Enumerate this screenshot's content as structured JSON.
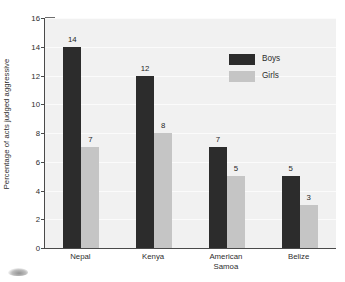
{
  "chart_data": {
    "type": "bar",
    "title": "",
    "subtitle": "",
    "xlabel": "",
    "ylabel": "Percentage of acts judged aggressive",
    "ylim": [
      0,
      16
    ],
    "ytick_labels": [
      "0",
      "2",
      "4",
      "6",
      "8",
      "10",
      "12",
      "14",
      "16"
    ],
    "ytick_values": [
      0,
      2,
      4,
      6,
      8,
      10,
      12,
      14,
      16
    ],
    "grid": "horizontal",
    "legend_position": "upper-right-inside",
    "categories": [
      "Nepal",
      "Kenya",
      "American Samoa",
      "Belize"
    ],
    "category_label_lines": [
      [
        "Nepal"
      ],
      [
        "Kenya"
      ],
      [
        "American",
        "Samoa"
      ],
      [
        "Belize"
      ]
    ],
    "series": [
      {
        "name": "Boys",
        "color": "#2c2c2c",
        "values": [
          14,
          12,
          7,
          5
        ],
        "value_labels": [
          "14",
          "12",
          "7",
          "5"
        ]
      },
      {
        "name": "Girls",
        "color": "#c5c5c5",
        "values": [
          7,
          8,
          5,
          3
        ],
        "value_labels": [
          "7",
          "8",
          "5",
          "3"
        ]
      }
    ],
    "colors": {
      "plot_background": "#f1f1f1",
      "gridline": "#fbfbfb",
      "axis": "#4a4a4a",
      "text": "#2d2d2d",
      "boys": "#2c2c2c",
      "girls": "#c5c5c5"
    }
  }
}
